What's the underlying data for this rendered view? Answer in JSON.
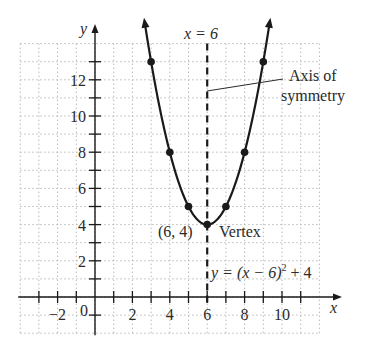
{
  "chart_data": {
    "type": "line",
    "title": "",
    "xlabel": "x",
    "ylabel": "y",
    "xlim": [
      -4,
      12
    ],
    "ylim": [
      -2,
      14
    ],
    "grid": true,
    "x_tick_labels": [
      "-2",
      "0",
      "2",
      "4",
      "6",
      "8",
      "10"
    ],
    "y_tick_labels": [
      "2",
      "4",
      "6",
      "8",
      "10",
      "12"
    ],
    "function": "y = (x - 6)^2 + 4",
    "series": [
      {
        "name": "y = (x - 6)² + 4",
        "x": [
          3,
          4,
          5,
          6,
          7,
          8,
          9
        ],
        "y": [
          13,
          8,
          5,
          4,
          5,
          8,
          13
        ]
      }
    ],
    "annotations": {
      "axis_line_label": "x = 6",
      "axis_callout_line1": "Axis of",
      "axis_callout_line2": "symmetry",
      "vertex_coord": "(6, 4)",
      "vertex_label": "Vertex",
      "equation_prefix": "y = (x − 6)",
      "equation_exp": "2",
      "equation_suffix": " + 4",
      "origin_label": "0",
      "x_axis_label": "x",
      "y_axis_label": "y"
    }
  }
}
